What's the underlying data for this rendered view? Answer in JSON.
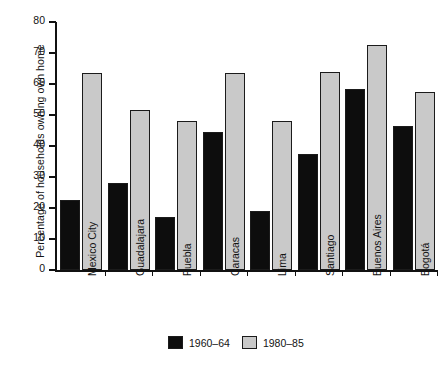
{
  "chart_data": {
    "type": "bar",
    "title": "",
    "xlabel": "",
    "ylabel": "Percentage of households owning own home",
    "ylim": [
      0,
      80
    ],
    "yticks": [
      0,
      10,
      20,
      30,
      40,
      50,
      60,
      70,
      80
    ],
    "grid": false,
    "legend_position": "bottom-center",
    "categories": [
      "Mexico City",
      "Guadalajara",
      "Puebla",
      "Caracas",
      "Lima",
      "Santiago",
      "Buenos Aires",
      "Bogotá"
    ],
    "series": [
      {
        "name": "1960-64",
        "color": "#0d0d0d",
        "values": [
          22.5,
          28.0,
          17.0,
          44.5,
          19.0,
          37.5,
          58.5,
          46.5
        ]
      },
      {
        "name": "1980-85",
        "color": "#c9c9c9",
        "values": [
          63.5,
          51.5,
          48.0,
          63.5,
          48.0,
          64.0,
          72.5,
          57.5
        ]
      }
    ]
  },
  "legend": {
    "items": [
      {
        "label": "1960–64",
        "swatch": "black-square-swatch"
      },
      {
        "label": "1980–85",
        "swatch": "gray-square-swatch"
      }
    ]
  },
  "axis": {
    "y_title": "Percentage of households owning own home",
    "y_tick_labels": [
      "0",
      "10",
      "20",
      "30",
      "40",
      "50",
      "60",
      "70",
      "80"
    ]
  }
}
